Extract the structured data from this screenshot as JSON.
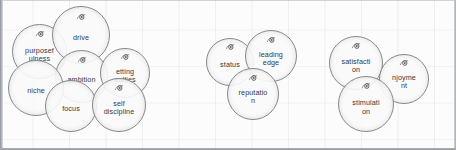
{
  "document": {
    "type": "bubble-cluster-diagram",
    "background": "faint-grid-paper",
    "colors": {
      "page": "#fcfcfc",
      "bubble_fill": "#fafafa",
      "bubble_stroke": "#7d7f85",
      "text": "#2b2c30",
      "grid_line": "#8c96a5",
      "page_edge": "#8e9097"
    }
  },
  "clusters": [
    {
      "name": "cluster-left",
      "bubbles": [
        {
          "label": "purposef\nulness",
          "icon": "bubble-marker-icon",
          "x": 12,
          "y": 24,
          "size": 55
        },
        {
          "label": "drive",
          "icon": "bubble-marker-icon",
          "x": 52,
          "y": 6,
          "size": 58
        },
        {
          "label": "ambition",
          "icon": "bubble-marker-icon",
          "x": 55,
          "y": 50,
          "size": 53
        },
        {
          "label": "etting\noalties",
          "icon": "bubble-marker-icon",
          "x": 100,
          "y": 48,
          "size": 50
        },
        {
          "label": "niche",
          "icon": null,
          "x": 8,
          "y": 60,
          "size": 56
        },
        {
          "label": "focus",
          "icon": null,
          "x": 45,
          "y": 80,
          "size": 52
        },
        {
          "label": "self\ndiscipline",
          "icon": "bubble-marker-icon",
          "x": 92,
          "y": 78,
          "size": 54
        }
      ]
    },
    {
      "name": "cluster-middle",
      "bubbles": [
        {
          "label": "status",
          "icon": "bubble-marker-icon",
          "x": 206,
          "y": 38,
          "size": 48
        },
        {
          "label": "leading\nedge",
          "icon": "bubble-marker-icon",
          "x": 245,
          "y": 30,
          "size": 52
        },
        {
          "label": "reputatio\nn",
          "icon": "bubble-marker-icon",
          "x": 227,
          "y": 68,
          "size": 52
        }
      ]
    },
    {
      "name": "cluster-right",
      "bubbles": [
        {
          "label": "satisfacti\non",
          "icon": "bubble-marker-icon",
          "x": 329,
          "y": 36,
          "size": 54
        },
        {
          "label": "njoyme\nnt",
          "icon": "bubble-marker-icon",
          "x": 379,
          "y": 54,
          "size": 50
        },
        {
          "label": "stimulati\non",
          "icon": "bubble-marker-icon",
          "x": 338,
          "y": 76,
          "size": 56
        }
      ]
    }
  ]
}
